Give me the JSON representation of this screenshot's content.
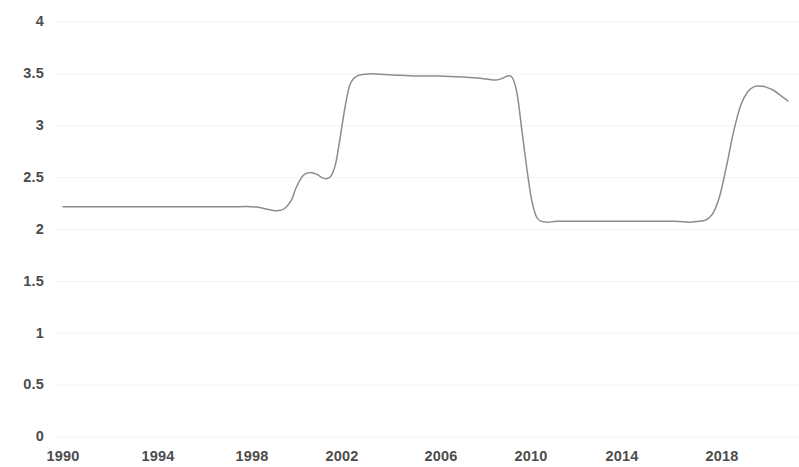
{
  "chart_data": {
    "type": "line",
    "title": "",
    "subtitle": "",
    "xlabel": "",
    "ylabel": "",
    "xlim": [
      1990,
      2020.8
    ],
    "ylim": [
      0,
      4
    ],
    "grid": false,
    "legend": null,
    "legend_position": "none",
    "line_color": "#8c8c8c",
    "text_color": "#4c4c4c",
    "background_color": "#ffffff",
    "y_ticks": [
      0,
      0.5,
      1,
      1.5,
      2,
      2.5,
      3,
      3.5,
      4
    ],
    "y_tick_labels": [
      "0",
      "0.5",
      "1",
      "1.5",
      "2",
      "2.5",
      "3",
      "3.5",
      "4"
    ],
    "x_ticks": [
      1990,
      1994,
      1998,
      2002,
      2006,
      2010,
      2014,
      2018
    ],
    "x_tick_labels": [
      "1990",
      "1994",
      "1998",
      "2002",
      "2006",
      "2010",
      "2014",
      "2018"
    ],
    "series": [
      {
        "name": "rate",
        "x": [
          1990.0,
          1990.8,
          1991.6,
          1992.4,
          1993.2,
          1994.0,
          1994.8,
          1995.6,
          1996.4,
          1997.2,
          1998.0,
          1998.4,
          1998.8,
          1999.1,
          1999.4,
          1999.7,
          1999.9,
          2000.2,
          2000.5,
          2000.8,
          2001.0,
          2001.2,
          2001.4,
          2001.6,
          2001.8,
          2002.0,
          2002.2,
          2002.5,
          2003.0,
          2004.0,
          2005.0,
          2006.0,
          2007.0,
          2007.6,
          2008.0,
          2008.4,
          2008.7,
          2008.9,
          2009.1,
          2009.3,
          2009.5,
          2009.7,
          2009.9,
          2010.1,
          2010.3,
          2010.6,
          2011.0,
          2012.0,
          2013.0,
          2014.0,
          2015.0,
          2016.0,
          2016.6,
          2017.0,
          2017.3,
          2017.6,
          2017.9,
          2018.2,
          2018.5,
          2018.8,
          2019.1,
          2019.4,
          2019.7,
          2019.9,
          2020.2,
          2020.5,
          2020.8
        ],
        "y": [
          2.22,
          2.22,
          2.22,
          2.22,
          2.22,
          2.22,
          2.22,
          2.22,
          2.22,
          2.22,
          2.22,
          2.21,
          2.19,
          2.18,
          2.2,
          2.28,
          2.4,
          2.52,
          2.55,
          2.53,
          2.5,
          2.49,
          2.52,
          2.65,
          2.92,
          3.2,
          3.4,
          3.48,
          3.5,
          3.49,
          3.48,
          3.48,
          3.47,
          3.46,
          3.45,
          3.44,
          3.46,
          3.48,
          3.46,
          3.3,
          2.95,
          2.6,
          2.3,
          2.13,
          2.08,
          2.07,
          2.08,
          2.08,
          2.08,
          2.08,
          2.08,
          2.08,
          2.07,
          2.08,
          2.09,
          2.15,
          2.32,
          2.62,
          2.95,
          3.2,
          3.33,
          3.38,
          3.38,
          3.37,
          3.34,
          3.29,
          3.24
        ]
      }
    ],
    "annotations": [],
    "notable_values": {
      "initial_plateau": 2.22,
      "first_local_peak": 2.55,
      "high_plateau": 3.5,
      "low_plateau": 2.08,
      "final_peak": 3.38,
      "final_value": 3.24
    }
  },
  "axis": {
    "y_labels": [
      "4",
      "3.5",
      "3",
      "2.5",
      "2",
      "1.5",
      "1",
      "0.5",
      "0"
    ],
    "x_labels": [
      "1990",
      "1994",
      "1998",
      "2002",
      "2006",
      "2010",
      "2014",
      "2018"
    ]
  }
}
